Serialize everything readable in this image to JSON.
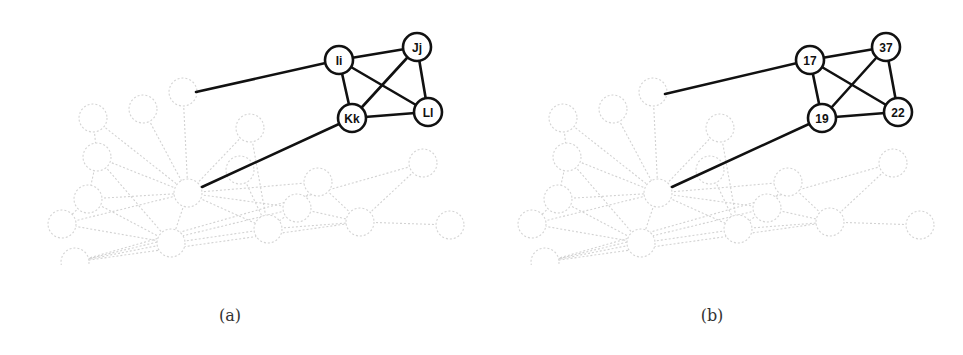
{
  "figure": {
    "panels": [
      {
        "id": "a",
        "caption": "(a)",
        "caption_x": 230,
        "offset_x": 0,
        "highlighted_nodes": [
          {
            "id": "Ii",
            "label": "Ii",
            "x": 339,
            "y": 60
          },
          {
            "id": "Jj",
            "label": "Jj",
            "x": 417,
            "y": 47
          },
          {
            "id": "Kk",
            "label": "Kk",
            "x": 352,
            "y": 118
          },
          {
            "id": "Ll",
            "label": "Ll",
            "x": 428,
            "y": 112
          }
        ],
        "highlighted_edges": [
          [
            "Ii",
            "Jj"
          ],
          [
            "Ii",
            "Kk"
          ],
          [
            "Ii",
            "Ll"
          ],
          [
            "Jj",
            "Kk"
          ],
          [
            "Jj",
            "Ll"
          ],
          [
            "Kk",
            "Ll"
          ]
        ],
        "bridge_edges": [
          {
            "from": "Ii",
            "to_point": [
              196,
              92
            ]
          },
          {
            "from": "Kk",
            "to_point": [
              202,
              187
            ]
          }
        ]
      },
      {
        "id": "b",
        "caption": "(b)",
        "caption_x": 712,
        "offset_x": 470,
        "highlighted_nodes": [
          {
            "id": "17",
            "label": "17",
            "x": 810,
            "y": 60
          },
          {
            "id": "37",
            "label": "37",
            "x": 886,
            "y": 47
          },
          {
            "id": "19",
            "label": "19",
            "x": 822,
            "y": 118
          },
          {
            "id": "22",
            "label": "22",
            "x": 898,
            "y": 112
          }
        ],
        "highlighted_edges": [
          [
            "17",
            "37"
          ],
          [
            "17",
            "19"
          ],
          [
            "17",
            "22"
          ],
          [
            "37",
            "19"
          ],
          [
            "37",
            "22"
          ],
          [
            "19",
            "22"
          ]
        ],
        "bridge_edges": [
          {
            "from": "17",
            "to_point": [
              665,
              94
            ]
          },
          {
            "from": "19",
            "to_point": [
              672,
              187
            ]
          }
        ]
      }
    ],
    "background_graph": {
      "style": "faded-dashed",
      "clip_y": 265,
      "nodes": [
        {
          "x": 93,
          "y": 118
        },
        {
          "x": 143,
          "y": 109
        },
        {
          "x": 183,
          "y": 92
        },
        {
          "x": 97,
          "y": 157
        },
        {
          "x": 250,
          "y": 128
        },
        {
          "x": 240,
          "y": 170
        },
        {
          "x": 88,
          "y": 199
        },
        {
          "x": 188,
          "y": 193
        },
        {
          "x": 62,
          "y": 224
        },
        {
          "x": 171,
          "y": 243
        },
        {
          "x": 268,
          "y": 229
        },
        {
          "x": 318,
          "y": 182
        },
        {
          "x": 297,
          "y": 208
        },
        {
          "x": 360,
          "y": 222
        },
        {
          "x": 423,
          "y": 163
        },
        {
          "x": 450,
          "y": 225
        },
        {
          "x": 75,
          "y": 262
        }
      ],
      "edges": [
        [
          0,
          3
        ],
        [
          3,
          6
        ],
        [
          6,
          8
        ],
        [
          1,
          7
        ],
        [
          2,
          7
        ],
        [
          3,
          7
        ],
        [
          6,
          7
        ],
        [
          8,
          7
        ],
        [
          7,
          9
        ],
        [
          9,
          6
        ],
        [
          9,
          8
        ],
        [
          7,
          4
        ],
        [
          7,
          5
        ],
        [
          5,
          10
        ],
        [
          7,
          10
        ],
        [
          7,
          11
        ],
        [
          11,
          12
        ],
        [
          12,
          10
        ],
        [
          10,
          13
        ],
        [
          12,
          13
        ],
        [
          11,
          13
        ],
        [
          13,
          14
        ],
        [
          14,
          16
        ],
        [
          9,
          10
        ],
        [
          13,
          15
        ],
        [
          7,
          12
        ],
        [
          3,
          9
        ],
        [
          0,
          7
        ],
        [
          4,
          10
        ],
        [
          12,
          16
        ],
        [
          9,
          16
        ],
        [
          13,
          16
        ]
      ]
    }
  }
}
